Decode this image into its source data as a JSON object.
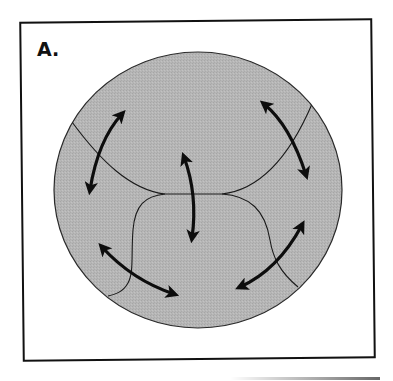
{
  "figure": {
    "panel_label": "A.",
    "colors": {
      "background": "#ffffff",
      "frame": "#111111",
      "circle_fill": "#b4b4b4",
      "circle_stroke": "#2a2a2a",
      "boundary_lines": "#1a1a1a",
      "arrows": "#0d0d0d"
    },
    "circle": {
      "cx": 198,
      "cy": 190,
      "rx": 144,
      "ry": 138
    },
    "regions": [
      "top-region",
      "left-region",
      "right-region",
      "bottom-center-region",
      "bottom-left-corner",
      "bottom-right-corner"
    ],
    "arrows": [
      {
        "id": "arrow-upper-left",
        "direction": "bidirectional",
        "from": [
          90,
          190
        ],
        "to": [
          122,
          113
        ]
      },
      {
        "id": "arrow-center",
        "direction": "bidirectional",
        "from": [
          184,
          157
        ],
        "to": [
          193,
          238
        ]
      },
      {
        "id": "arrow-upper-right",
        "direction": "bidirectional",
        "from": [
          264,
          104
        ],
        "to": [
          306,
          175
        ]
      },
      {
        "id": "arrow-lower-left",
        "direction": "bidirectional",
        "from": [
          102,
          245
        ],
        "to": [
          174,
          294
        ]
      },
      {
        "id": "arrow-lower-right",
        "direction": "bidirectional",
        "from": [
          240,
          287
        ],
        "to": [
          302,
          225
        ]
      }
    ]
  }
}
